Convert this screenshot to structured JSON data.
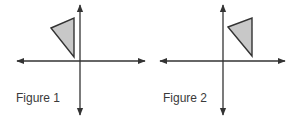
{
  "figures": [
    {
      "label": "Figure 1",
      "axes": {
        "origin": [
          80,
          61
        ],
        "x_range": [
          16,
          146
        ],
        "y_range": [
          4,
          116
        ]
      },
      "triangle": {
        "points": "51,28 74,18 74,57",
        "fill": "#c8c8c8",
        "stroke": "#333333"
      }
    },
    {
      "label": "Figure 2",
      "axes": {
        "origin": [
          223,
          61
        ],
        "x_range": [
          159,
          286
        ],
        "y_range": [
          4,
          116
        ]
      },
      "triangle": {
        "points": "228,27 252,18 252,56",
        "fill": "#c8c8c8",
        "stroke": "#333333"
      }
    }
  ],
  "colors": {
    "axis": "#333333",
    "shape_fill": "#c8c8c8",
    "label": "#3a3a3a"
  }
}
